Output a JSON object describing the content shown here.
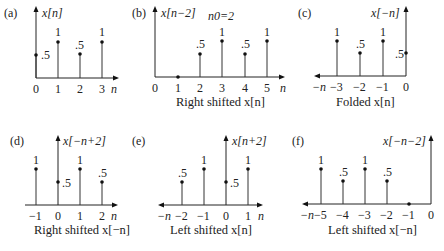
{
  "figure": {
    "panels": [
      {
        "id": "a",
        "tag": "(a)",
        "ylabel": "x[n]",
        "caption": "",
        "note": "",
        "n_label": "n",
        "n_label_side": "right",
        "axis_origin_n": 0,
        "ticks": [
          "0",
          "1",
          "2",
          "3"
        ],
        "samples": [
          {
            "n": 0,
            "value": 0.5,
            "label": ".5"
          },
          {
            "n": 1,
            "value": 1,
            "label": "1"
          },
          {
            "n": 2,
            "value": 0.5,
            "label": ".5"
          },
          {
            "n": 3,
            "value": 1,
            "label": "1"
          }
        ]
      },
      {
        "id": "b",
        "tag": "(b)",
        "ylabel": "x[n−2]",
        "caption": "Right shifted x[n]",
        "note": "n0=2",
        "n_label": "n",
        "n_label_side": "right",
        "axis_origin_n": 0,
        "ticks": [
          "0",
          "1",
          "2",
          "3",
          "4",
          "5"
        ],
        "samples": [
          {
            "n": 1,
            "value": 0,
            "label": ""
          },
          {
            "n": 2,
            "value": 0.5,
            "label": ".5"
          },
          {
            "n": 3,
            "value": 1,
            "label": "1"
          },
          {
            "n": 4,
            "value": 0.5,
            "label": ".5"
          },
          {
            "n": 5,
            "value": 1,
            "label": "1"
          }
        ]
      },
      {
        "id": "c",
        "tag": "(c)",
        "ylabel": "x[−n]",
        "caption": "Folded x[n]",
        "note": "",
        "n_label": "−n",
        "n_label_side": "left",
        "axis_origin_n": 0,
        "ticks": [
          "−3",
          "−2",
          "−1",
          "0"
        ],
        "samples": [
          {
            "n": -3,
            "value": 1,
            "label": "1"
          },
          {
            "n": -2,
            "value": 0.5,
            "label": ".5"
          },
          {
            "n": -1,
            "value": 1,
            "label": "1"
          },
          {
            "n": 0,
            "value": 0.5,
            "label": ".5"
          }
        ]
      },
      {
        "id": "d",
        "tag": "(d)",
        "ylabel": "x[−n+2]",
        "caption": "Right shifted x[−n]",
        "note": "",
        "n_label": "n",
        "n_label_side": "right",
        "axis_origin_n": 0,
        "ticks": [
          "−1",
          "0",
          "1",
          "2"
        ],
        "samples": [
          {
            "n": -1,
            "value": 1,
            "label": "1"
          },
          {
            "n": 0,
            "value": 0.5,
            "label": ".5"
          },
          {
            "n": 1,
            "value": 1,
            "label": "1"
          },
          {
            "n": 2,
            "value": 0.5,
            "label": ".5"
          }
        ]
      },
      {
        "id": "e",
        "tag": "(e)",
        "ylabel": "x[n+2]",
        "caption": "Left shifted x[n]",
        "note": "",
        "n_label": "n",
        "n_label_left": "−n",
        "n_label_side": "both",
        "axis_origin_n": 0,
        "ticks": [
          "−2",
          "−1",
          "0",
          "1"
        ],
        "samples": [
          {
            "n": -2,
            "value": 0.5,
            "label": ".5"
          },
          {
            "n": -1,
            "value": 1,
            "label": "1"
          },
          {
            "n": 0,
            "value": 0.5,
            "label": ".5"
          },
          {
            "n": 1,
            "value": 1,
            "label": "1"
          }
        ]
      },
      {
        "id": "f",
        "tag": "(f)",
        "ylabel": "x[−n−2]",
        "caption": "Left shifted x[−n]",
        "note": "",
        "n_label": "−n",
        "n_label_side": "left",
        "axis_origin_n": 0,
        "ticks": [
          "−5",
          "−4",
          "−3",
          "−2",
          "−1",
          "0"
        ],
        "samples": [
          {
            "n": -5,
            "value": 1,
            "label": "1"
          },
          {
            "n": -4,
            "value": 0.5,
            "label": ".5"
          },
          {
            "n": -3,
            "value": 1,
            "label": "1"
          },
          {
            "n": -2,
            "value": 0.5,
            "label": ".5"
          },
          {
            "n": -1,
            "value": 0,
            "label": ""
          }
        ]
      }
    ]
  }
}
